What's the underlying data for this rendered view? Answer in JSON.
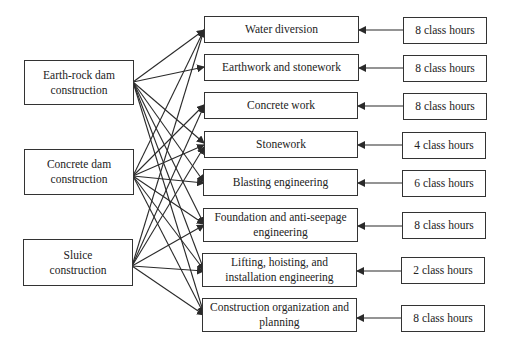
{
  "diagram": {
    "sources": [
      {
        "id": "earth-rock",
        "label_line1": "Earth-rock dam",
        "label_line2": "construction"
      },
      {
        "id": "concrete-dam",
        "label_line1": "Concrete dam",
        "label_line2": "construction"
      },
      {
        "id": "sluice",
        "label_line1": "Sluice",
        "label_line2": "construction"
      }
    ],
    "courses": [
      {
        "label_line1": "Water diversion",
        "label_line2": "",
        "hours": "8 class hours"
      },
      {
        "label_line1": "Earthwork and stonework",
        "label_line2": "",
        "hours": "8 class hours"
      },
      {
        "label_line1": "Concrete work",
        "label_line2": "",
        "hours": "8 class hours"
      },
      {
        "label_line1": "Stonework",
        "label_line2": "",
        "hours": "4 class hours"
      },
      {
        "label_line1": "Blasting engineering",
        "label_line2": "",
        "hours": "6 class hours"
      },
      {
        "label_line1": "Foundation and anti-seepage",
        "label_line2": "engineering",
        "hours": "8 class hours"
      },
      {
        "label_line1": "Lifting, hoisting, and",
        "label_line2": "installation engineering",
        "hours": "2 class hours"
      },
      {
        "label_line1": "Construction organization and",
        "label_line2": "planning",
        "hours": "8 class hours"
      }
    ],
    "edges": [
      {
        "from": "earth-rock",
        "to": [
          0,
          1,
          3,
          4,
          5,
          6,
          7
        ]
      },
      {
        "from": "concrete-dam",
        "to": [
          0,
          2,
          3,
          4,
          5,
          6,
          7
        ]
      },
      {
        "from": "sluice",
        "to": [
          0,
          2,
          3,
          5,
          6,
          7
        ]
      }
    ],
    "colors": {
      "line": "#2a2a2a",
      "border": "#333333",
      "background": "#ffffff"
    }
  }
}
